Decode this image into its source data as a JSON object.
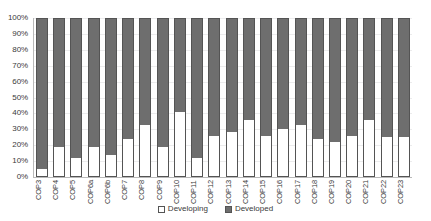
{
  "chart_data": {
    "type": "bar",
    "subtype": "stacked-100-percent",
    "title": "",
    "subtitle": "",
    "xlabel": "",
    "ylabel": "",
    "ylim": [
      0,
      100
    ],
    "ytick_labels": [
      "100%",
      "90%",
      "80%",
      "70%",
      "60%",
      "50%",
      "40%",
      "30%",
      "20%",
      "10%",
      "0%"
    ],
    "ytick_values": [
      100,
      90,
      80,
      70,
      60,
      50,
      40,
      30,
      20,
      10,
      0
    ],
    "grid": true,
    "legend_position": "bottom",
    "categories": [
      "COP3",
      "COP4",
      "COP5",
      "COP6a",
      "COP6b",
      "COP7",
      "COP8",
      "COP9",
      "COP10",
      "COP11",
      "COP12",
      "COP13",
      "COP14",
      "COP15",
      "COP16",
      "COP17",
      "COP18",
      "COP19",
      "COP20",
      "COP21",
      "COP22",
      "COP23"
    ],
    "series": [
      {
        "name": "Developing",
        "color": "#ffffff",
        "values": [
          5,
          19,
          12,
          19,
          14,
          24,
          33,
          19,
          41,
          12,
          26,
          28,
          36,
          26,
          30,
          33,
          24,
          22,
          26,
          36,
          25,
          25
        ]
      },
      {
        "name": "Developed",
        "color": "#6e6e6e",
        "values": [
          95,
          81,
          88,
          81,
          86,
          76,
          67,
          81,
          59,
          88,
          74,
          72,
          64,
          74,
          70,
          67,
          76,
          78,
          74,
          64,
          75,
          75
        ]
      }
    ]
  },
  "legend": {
    "entries": [
      {
        "label": "Developing",
        "swatch": "open-square-swatch"
      },
      {
        "label": "Developed",
        "swatch": "filled-square-swatch"
      }
    ]
  },
  "colors": {
    "developed_fill": "#6e6e6e",
    "developing_fill": "#ffffff",
    "bar_outline": "#545454",
    "axis_line": "#b9b9b9",
    "gridline": "#ececed",
    "text": "#3a3a3a",
    "background": "#ffffff"
  }
}
